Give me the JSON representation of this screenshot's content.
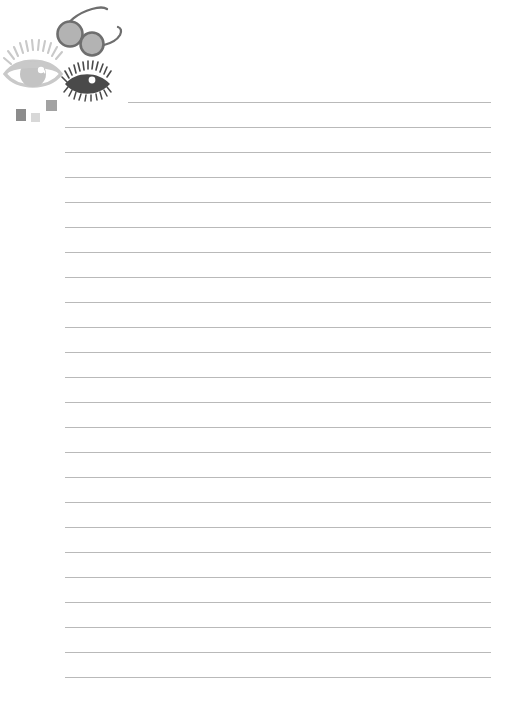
{
  "page": {
    "background_color": "#ffffff",
    "width": 509,
    "height": 711
  },
  "rules": {
    "label": "Ruled writing lines",
    "count": 24,
    "color": "#b9b9b9",
    "thickness_px": 1,
    "first_line_y": 102,
    "spacing_px": 25,
    "left_x": 65,
    "right_x": 491,
    "first_line_left_x": 128,
    "first_line_indented": "true"
  },
  "clipart": {
    "label": "Eyes and spectacles decoration",
    "glasses": {
      "label": "Round spectacles",
      "lens_fill": "#b3b3b3",
      "rim_color": "#6e6e6e",
      "temple_color": "#6e6e6e"
    },
    "big_eye": {
      "label": "Large open eye with lashes",
      "color": "#c9c9c9",
      "iris_color": "#b0b0b0",
      "highlight_color": "#ffffff"
    },
    "small_eye": {
      "label": "Small dark eye with lashes",
      "color": "#4a4a4a",
      "iris_color": "#3a3a3a",
      "highlight_color": "#ffffff"
    }
  },
  "squares": [
    {
      "name": "dark-square",
      "color": "#8c8c8c"
    },
    {
      "name": "light-square",
      "color": "#d8d8d8"
    },
    {
      "name": "mid-square",
      "color": "#a2a2a2"
    }
  ]
}
